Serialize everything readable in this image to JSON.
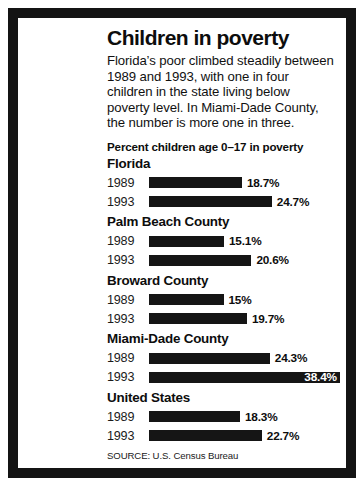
{
  "headline": "Children in poverty",
  "deck": "Florida’s poor climbed steadily between 1989 and 1993, with one in four children in the state living below poverty level. In Miami-Dade County, the number is more one in three.",
  "source": "SOURCE: U.S. Census Bureau",
  "chart_data": {
    "type": "bar",
    "title": "Children in poverty",
    "subtitle": "Percent children age 0–17 in poverty",
    "xlabel": "",
    "ylabel": "",
    "xlim": [
      0,
      40
    ],
    "grid": false,
    "legend": "none",
    "orientation": "horizontal",
    "units": "percent",
    "bar_color": "#151515",
    "groups": [
      {
        "name": "Florida",
        "bars": [
          {
            "year": "1989",
            "value": 18.7,
            "label": "18.7%",
            "label_inside": false
          },
          {
            "year": "1993",
            "value": 24.7,
            "label": "24.7%",
            "label_inside": false
          }
        ]
      },
      {
        "name": "Palm Beach County",
        "bars": [
          {
            "year": "1989",
            "value": 15.1,
            "label": "15.1%",
            "label_inside": false
          },
          {
            "year": "1993",
            "value": 20.6,
            "label": "20.6%",
            "label_inside": false
          }
        ]
      },
      {
        "name": "Broward County",
        "bars": [
          {
            "year": "1989",
            "value": 15.0,
            "label": "15%",
            "label_inside": false
          },
          {
            "year": "1993",
            "value": 19.7,
            "label": "19.7%",
            "label_inside": false
          }
        ]
      },
      {
        "name": "Miami-Dade County",
        "bars": [
          {
            "year": "1989",
            "value": 24.3,
            "label": "24.3%",
            "label_inside": false
          },
          {
            "year": "1993",
            "value": 38.4,
            "label": "38.4%",
            "label_inside": true
          }
        ]
      },
      {
        "name": "United States",
        "bars": [
          {
            "year": "1989",
            "value": 18.3,
            "label": "18.3%",
            "label_inside": false
          },
          {
            "year": "1993",
            "value": 22.7,
            "label": "22.7%",
            "label_inside": false
          }
        ]
      }
    ]
  }
}
